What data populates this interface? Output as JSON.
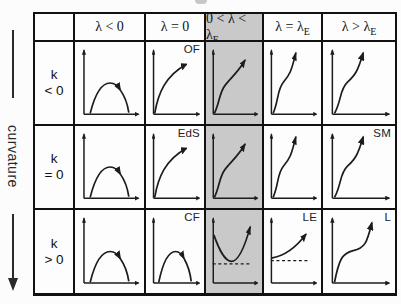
{
  "meta": {
    "background": "#fcfcfc",
    "line_color": "#222222",
    "highlight_color": "#c9c9c9"
  },
  "side_label": "curvature",
  "columns": [
    "",
    "λ < 0",
    "λ = 0",
    "0 < λ < λ_E",
    "λ = λ_E",
    "λ > λ_E"
  ],
  "highlight_column": 3,
  "rows": [
    {
      "label_line1": "k",
      "label_line2": "< 0",
      "cells": [
        {
          "curve": "recollapse",
          "tag": ""
        },
        {
          "curve": "decelerating",
          "tag": "OF"
        },
        {
          "curve": "inflection",
          "tag": ""
        },
        {
          "curve": "accelerating",
          "tag": ""
        },
        {
          "curve": "accelerating",
          "tag": ""
        }
      ]
    },
    {
      "label_line1": "k",
      "label_line2": "= 0",
      "cells": [
        {
          "curve": "recollapse",
          "tag": ""
        },
        {
          "curve": "decelerating",
          "tag": "EdS"
        },
        {
          "curve": "inflection",
          "tag": ""
        },
        {
          "curve": "accelerating",
          "tag": ""
        },
        {
          "curve": "accelerating",
          "tag": "SM"
        }
      ]
    },
    {
      "label_line1": "k",
      "label_line2": "> 0",
      "cells": [
        {
          "curve": "recollapse",
          "tag": ""
        },
        {
          "curve": "recollapse",
          "tag": "CF"
        },
        {
          "curve": "bounce",
          "tag": "",
          "dashed": true
        },
        {
          "curve": "coasting",
          "tag": "LE",
          "dashed": true
        },
        {
          "curve": "loitering",
          "tag": "L"
        }
      ]
    }
  ]
}
